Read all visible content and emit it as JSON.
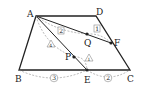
{
  "diagram": {
    "type": "trapezoid geometry figure",
    "points": {
      "A": {
        "label": "A",
        "x": 36,
        "y": 16
      },
      "D": {
        "label": "D",
        "x": 96,
        "y": 16
      },
      "B": {
        "label": "B",
        "x": 19,
        "y": 70
      },
      "C": {
        "label": "C",
        "x": 130,
        "y": 70
      },
      "E": {
        "label": "E",
        "x": 87,
        "y": 70
      },
      "F": {
        "label": "F",
        "x": 111,
        "y": 43
      },
      "Q": {
        "label": "Q",
        "x": 87,
        "y": 34
      },
      "P": {
        "label": "P",
        "x": 74,
        "y": 57
      }
    },
    "ratio_labels": {
      "AQ_box": "2",
      "QF_box": "1",
      "AP_triangle": "4",
      "PE_triangle": "1",
      "BE_circle": "3",
      "EC_circle": "2"
    },
    "colors": {
      "stroke": "#222222",
      "dashed": "#888888",
      "background": "#ffffff"
    }
  }
}
